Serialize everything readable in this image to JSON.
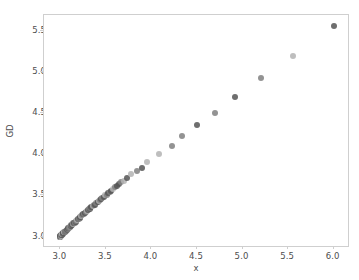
{
  "chart_data": {
    "type": "scatter",
    "title": "",
    "xlabel": "x",
    "ylabel": "GD",
    "xlim": [
      2.82,
      6.18
    ],
    "ylim": [
      2.86,
      5.7
    ],
    "grid": false,
    "legend": null,
    "xticks": [
      "3.0",
      "3.5",
      "4.0",
      "4.5",
      "5.0",
      "5.5",
      "6.0"
    ],
    "xtick_values": [
      3.0,
      3.5,
      4.0,
      4.5,
      5.0,
      5.5,
      6.0
    ],
    "yticks": [
      "3.0",
      "3.5",
      "4.0",
      "4.5",
      "5.0",
      "5.5"
    ],
    "ytick_values": [
      3.0,
      3.5,
      4.0,
      4.5,
      5.0,
      5.5
    ],
    "marker": "circle",
    "marker_size_px": 6,
    "colors": {
      "marker_dark": "#555555",
      "marker_mid": "#808080",
      "marker_light": "#b3b3b3",
      "spine": "#cfcfcf",
      "text": "#4d4d4d",
      "background": "#ffffff"
    },
    "points": [
      {
        "x": 3.0,
        "y": 3.0,
        "shade": "dark"
      },
      {
        "x": 3.0,
        "y": 3.0,
        "shade": "mid"
      },
      {
        "x": 3.0,
        "y": 3.0,
        "shade": "dark"
      },
      {
        "x": 3.0,
        "y": 3.0,
        "shade": "light"
      },
      {
        "x": 3.0,
        "y": 3.01,
        "shade": "mid"
      },
      {
        "x": 3.0,
        "y": 3.01,
        "shade": "dark"
      },
      {
        "x": 3.01,
        "y": 3.01,
        "shade": "mid"
      },
      {
        "x": 3.01,
        "y": 3.01,
        "shade": "light"
      },
      {
        "x": 3.01,
        "y": 3.02,
        "shade": "dark"
      },
      {
        "x": 3.01,
        "y": 3.02,
        "shade": "mid"
      },
      {
        "x": 3.02,
        "y": 3.02,
        "shade": "dark"
      },
      {
        "x": 3.02,
        "y": 3.03,
        "shade": "mid"
      },
      {
        "x": 3.02,
        "y": 3.03,
        "shade": "light"
      },
      {
        "x": 3.03,
        "y": 3.03,
        "shade": "dark"
      },
      {
        "x": 3.03,
        "y": 3.04,
        "shade": "mid"
      },
      {
        "x": 3.03,
        "y": 3.04,
        "shade": "dark"
      },
      {
        "x": 3.04,
        "y": 3.05,
        "shade": "mid"
      },
      {
        "x": 3.04,
        "y": 3.05,
        "shade": "light"
      },
      {
        "x": 3.05,
        "y": 3.06,
        "shade": "dark"
      },
      {
        "x": 3.05,
        "y": 3.06,
        "shade": "mid"
      },
      {
        "x": 3.06,
        "y": 3.07,
        "shade": "dark"
      },
      {
        "x": 3.06,
        "y": 3.07,
        "shade": "mid"
      },
      {
        "x": 3.07,
        "y": 3.08,
        "shade": "light"
      },
      {
        "x": 3.07,
        "y": 3.08,
        "shade": "dark"
      },
      {
        "x": 3.08,
        "y": 3.09,
        "shade": "mid"
      },
      {
        "x": 3.08,
        "y": 3.1,
        "shade": "dark"
      },
      {
        "x": 3.09,
        "y": 3.1,
        "shade": "mid"
      },
      {
        "x": 3.1,
        "y": 3.11,
        "shade": "dark"
      },
      {
        "x": 3.1,
        "y": 3.12,
        "shade": "light"
      },
      {
        "x": 3.11,
        "y": 3.12,
        "shade": "mid"
      },
      {
        "x": 3.12,
        "y": 3.13,
        "shade": "dark"
      },
      {
        "x": 3.12,
        "y": 3.14,
        "shade": "mid"
      },
      {
        "x": 3.13,
        "y": 3.14,
        "shade": "dark"
      },
      {
        "x": 3.14,
        "y": 3.15,
        "shade": "light"
      },
      {
        "x": 3.14,
        "y": 3.16,
        "shade": "mid"
      },
      {
        "x": 3.15,
        "y": 3.17,
        "shade": "dark"
      },
      {
        "x": 3.16,
        "y": 3.17,
        "shade": "mid"
      },
      {
        "x": 3.17,
        "y": 3.18,
        "shade": "dark"
      },
      {
        "x": 3.17,
        "y": 3.19,
        "shade": "mid"
      },
      {
        "x": 3.18,
        "y": 3.2,
        "shade": "light"
      },
      {
        "x": 3.19,
        "y": 3.21,
        "shade": "dark"
      },
      {
        "x": 3.2,
        "y": 3.21,
        "shade": "mid"
      },
      {
        "x": 3.21,
        "y": 3.22,
        "shade": "dark"
      },
      {
        "x": 3.22,
        "y": 3.23,
        "shade": "mid"
      },
      {
        "x": 3.22,
        "y": 3.24,
        "shade": "dark"
      },
      {
        "x": 3.23,
        "y": 3.25,
        "shade": "light"
      },
      {
        "x": 3.24,
        "y": 3.26,
        "shade": "mid"
      },
      {
        "x": 3.25,
        "y": 3.27,
        "shade": "dark"
      },
      {
        "x": 3.26,
        "y": 3.28,
        "shade": "mid"
      },
      {
        "x": 3.27,
        "y": 3.29,
        "shade": "dark"
      },
      {
        "x": 3.28,
        "y": 3.3,
        "shade": "mid"
      },
      {
        "x": 3.29,
        "y": 3.31,
        "shade": "light"
      },
      {
        "x": 3.3,
        "y": 3.32,
        "shade": "dark"
      },
      {
        "x": 3.31,
        "y": 3.33,
        "shade": "mid"
      },
      {
        "x": 3.32,
        "y": 3.34,
        "shade": "dark"
      },
      {
        "x": 3.33,
        "y": 3.35,
        "shade": "mid"
      },
      {
        "x": 3.34,
        "y": 3.36,
        "shade": "dark"
      },
      {
        "x": 3.36,
        "y": 3.37,
        "shade": "light"
      },
      {
        "x": 3.37,
        "y": 3.38,
        "shade": "mid"
      },
      {
        "x": 3.38,
        "y": 3.39,
        "shade": "dark"
      },
      {
        "x": 3.39,
        "y": 3.41,
        "shade": "mid"
      },
      {
        "x": 3.41,
        "y": 3.42,
        "shade": "dark"
      },
      {
        "x": 3.42,
        "y": 3.43,
        "shade": "light"
      },
      {
        "x": 3.43,
        "y": 3.44,
        "shade": "mid"
      },
      {
        "x": 3.45,
        "y": 3.46,
        "shade": "dark"
      },
      {
        "x": 3.46,
        "y": 3.47,
        "shade": "mid"
      },
      {
        "x": 3.48,
        "y": 3.48,
        "shade": "dark"
      },
      {
        "x": 3.49,
        "y": 3.5,
        "shade": "light"
      },
      {
        "x": 3.51,
        "y": 3.51,
        "shade": "mid"
      },
      {
        "x": 3.52,
        "y": 3.53,
        "shade": "dark"
      },
      {
        "x": 3.54,
        "y": 3.54,
        "shade": "mid"
      },
      {
        "x": 3.56,
        "y": 3.56,
        "shade": "dark"
      },
      {
        "x": 3.58,
        "y": 3.58,
        "shade": "light"
      },
      {
        "x": 3.6,
        "y": 3.6,
        "shade": "mid"
      },
      {
        "x": 3.62,
        "y": 3.62,
        "shade": "dark"
      },
      {
        "x": 3.64,
        "y": 3.64,
        "shade": "dark"
      },
      {
        "x": 3.67,
        "y": 3.66,
        "shade": "mid"
      },
      {
        "x": 3.7,
        "y": 3.68,
        "shade": "light"
      },
      {
        "x": 3.73,
        "y": 3.71,
        "shade": "dark"
      },
      {
        "x": 3.78,
        "y": 3.76,
        "shade": "light"
      },
      {
        "x": 3.84,
        "y": 3.8,
        "shade": "mid"
      },
      {
        "x": 3.9,
        "y": 3.83,
        "shade": "dark"
      },
      {
        "x": 3.95,
        "y": 3.91,
        "shade": "light"
      },
      {
        "x": 4.08,
        "y": 4.0,
        "shade": "light"
      },
      {
        "x": 4.22,
        "y": 4.1,
        "shade": "mid"
      },
      {
        "x": 4.34,
        "y": 4.22,
        "shade": "mid"
      },
      {
        "x": 4.5,
        "y": 4.36,
        "shade": "dark"
      },
      {
        "x": 4.7,
        "y": 4.51,
        "shade": "mid"
      },
      {
        "x": 4.92,
        "y": 4.7,
        "shade": "dark"
      },
      {
        "x": 5.2,
        "y": 4.93,
        "shade": "mid"
      },
      {
        "x": 5.55,
        "y": 5.2,
        "shade": "light"
      },
      {
        "x": 6.0,
        "y": 5.56,
        "shade": "dark"
      }
    ]
  }
}
